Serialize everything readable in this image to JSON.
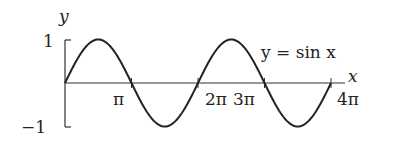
{
  "chart_data": {
    "type": "line",
    "title": "",
    "xlabel": "x",
    "ylabel": "y",
    "annotation": "y = sin x",
    "function": "sin(x)",
    "x_range": [
      0,
      12.566
    ],
    "xlim": [
      0,
      12.566
    ],
    "ylim": [
      -1,
      1
    ],
    "x_ticks": [
      3.1416,
      6.2832,
      9.4248,
      12.566
    ],
    "x_tick_labels": [
      "π",
      "2π",
      "3π",
      "4π"
    ],
    "y_ticks": [
      1,
      -1
    ],
    "y_tick_labels": [
      "1",
      "−1"
    ],
    "x": [
      0,
      1.5708,
      3.1416,
      4.7124,
      6.2832,
      7.854,
      9.4248,
      10.9956,
      12.566
    ],
    "series": [
      {
        "name": "y = sin x",
        "values": [
          0,
          1,
          0,
          -1,
          0,
          1,
          0,
          -1,
          0
        ]
      }
    ],
    "grid": false,
    "legend": "none"
  },
  "labels": {
    "y_axis": "y",
    "x_axis": "x",
    "curve": "y = sin x",
    "tick_one": "1",
    "tick_neg_one": "−1",
    "tick_pi": "π",
    "tick_2pi": "2π",
    "tick_3pi": "3π",
    "tick_4pi": "4π"
  }
}
